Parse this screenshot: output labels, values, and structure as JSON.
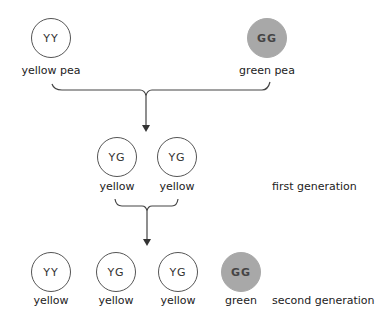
{
  "parents": [
    {
      "genotype": "YY",
      "label": "yellow pea",
      "color": "yellow"
    },
    {
      "genotype": "GG",
      "label": "green pea",
      "color": "green"
    }
  ],
  "first_generation": {
    "label": "first generation",
    "offspring": [
      {
        "genotype": "YG",
        "label": "yellow"
      },
      {
        "genotype": "YG",
        "label": "yellow"
      }
    ]
  },
  "second_generation": {
    "label": "second generation",
    "offspring": [
      {
        "genotype": "YY",
        "label": "yellow"
      },
      {
        "genotype": "YG",
        "label": "yellow"
      },
      {
        "genotype": "YG",
        "label": "yellow"
      },
      {
        "genotype": "GG",
        "label": "green"
      }
    ]
  },
  "caption": "Figure ... Mendel's pea-colour inheritance (cut off)",
  "colors": {
    "green_fill": "#a8a8a8",
    "line": "#444444"
  }
}
